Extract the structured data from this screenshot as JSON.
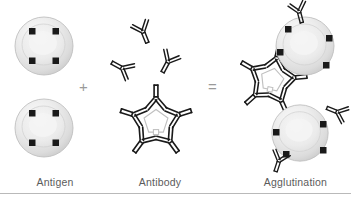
{
  "figure": {
    "width": 351,
    "height": 201,
    "background_color": "#ffffff"
  },
  "labels": {
    "antigen": "Antigen",
    "antibody": "Antibody",
    "agglutination": "Agglutination",
    "label_color": "#5b5b5b"
  },
  "operators": {
    "plus": "+",
    "equals": "=",
    "operator_color": "#9a9a9a"
  },
  "colors": {
    "cell_fill_light": "#f2f2f2",
    "cell_fill_mid": "#e2e2e2",
    "cell_fill_dark": "#c9c9c9",
    "cell_edge": "#bdbdbd",
    "epitope": "#1a1a1a",
    "antibody_stroke": "#1a1a1a",
    "antibody_fill": "#ffffff",
    "divider": "#b9b9b9"
  },
  "panels": {
    "antigen": {
      "name": "Antigen",
      "cells": [
        {
          "cx": 44,
          "cy": 46,
          "r": 29,
          "epitope_angles": [
            208,
            332,
            152,
            28
          ]
        },
        {
          "cx": 44,
          "cy": 128,
          "r": 29,
          "epitope_angles": [
            208,
            332,
            152,
            28
          ]
        }
      ],
      "epitope_count_per_cell": 4
    },
    "antibody": {
      "name": "Antibody",
      "free_antibodies": [
        {
          "cx": 143,
          "cy": 32,
          "rot": -22,
          "scale": 1.0
        },
        {
          "cx": 122,
          "cy": 68,
          "rot": 118,
          "scale": 1.0
        },
        {
          "cx": 168,
          "cy": 62,
          "rot": 28,
          "scale": 1.0
        }
      ],
      "pentamer": {
        "cx": 156,
        "cy": 122,
        "arms": 5,
        "scale": 1.0,
        "rot": 0
      }
    },
    "agglutination": {
      "name": "Agglutination",
      "cells": [
        {
          "cx": 305,
          "cy": 46,
          "r": 29,
          "epitope_angles": [
            196,
            338,
            145,
            42
          ]
        },
        {
          "cx": 300,
          "cy": 133,
          "r": 28,
          "epitope_angles": [
            200,
            340,
            150,
            35
          ]
        }
      ],
      "pentamer": {
        "cx": 272,
        "cy": 80,
        "arms": 5,
        "scale": 0.95,
        "rot": 12
      },
      "bound_antibodies": [
        {
          "cx": 299,
          "cy": 12,
          "rot": -15,
          "scale": 0.95
        },
        {
          "cx": 337,
          "cy": 112,
          "rot": 112,
          "scale": 0.95
        },
        {
          "cx": 279,
          "cy": 161,
          "rot": 18,
          "scale": 0.95
        }
      ]
    }
  }
}
